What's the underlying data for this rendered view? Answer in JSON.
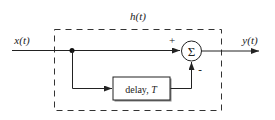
{
  "diagram": {
    "type": "block-diagram",
    "system_label": "h(t)",
    "input_label": "x(t)",
    "output_label": "y(t)",
    "sum_symbol": "Σ",
    "plus_sign": "+",
    "minus_sign": "-",
    "delay_block": {
      "text": "delay, ",
      "param": "T"
    },
    "colors": {
      "line": "#222222",
      "background": "#ffffff",
      "block_fill": "#ffffff"
    }
  }
}
